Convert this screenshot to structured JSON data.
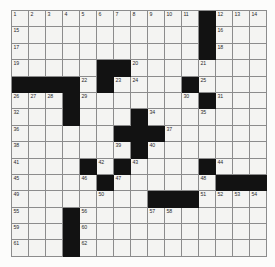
{
  "puzzle": {
    "type": "crossword-grid",
    "rows": 15,
    "columns": 15,
    "cell_size_px": 17,
    "colors": {
      "block": "#121212",
      "open": "#f4f4f2",
      "gridline": "#8c8c8c",
      "number_text": "#2a2a2a",
      "page_background": "#fcfcfb"
    },
    "blocks": [
      [
        0,
        11
      ],
      [
        1,
        11
      ],
      [
        2,
        11
      ],
      [
        3,
        5
      ],
      [
        3,
        6
      ],
      [
        4,
        0
      ],
      [
        4,
        1
      ],
      [
        4,
        2
      ],
      [
        4,
        3
      ],
      [
        4,
        5
      ],
      [
        4,
        10
      ],
      [
        5,
        3
      ],
      [
        5,
        11
      ],
      [
        6,
        3
      ],
      [
        6,
        7
      ],
      [
        7,
        6
      ],
      [
        7,
        7
      ],
      [
        7,
        8
      ],
      [
        8,
        7
      ],
      [
        9,
        4
      ],
      [
        9,
        6
      ],
      [
        9,
        11
      ],
      [
        10,
        5
      ],
      [
        10,
        12
      ],
      [
        10,
        13
      ],
      [
        10,
        14
      ],
      [
        11,
        8
      ],
      [
        11,
        9
      ],
      [
        11,
        10
      ],
      [
        12,
        3
      ],
      [
        13,
        3
      ],
      [
        14,
        3
      ]
    ],
    "numbers": [
      {
        "row": 0,
        "col": 0,
        "label": "1"
      },
      {
        "row": 0,
        "col": 1,
        "label": "2"
      },
      {
        "row": 0,
        "col": 2,
        "label": "3"
      },
      {
        "row": 0,
        "col": 3,
        "label": "4"
      },
      {
        "row": 0,
        "col": 4,
        "label": "5"
      },
      {
        "row": 0,
        "col": 5,
        "label": "6"
      },
      {
        "row": 0,
        "col": 6,
        "label": "7"
      },
      {
        "row": 0,
        "col": 7,
        "label": "8"
      },
      {
        "row": 0,
        "col": 8,
        "label": "9"
      },
      {
        "row": 0,
        "col": 9,
        "label": "10"
      },
      {
        "row": 0,
        "col": 10,
        "label": "11"
      },
      {
        "row": 0,
        "col": 12,
        "label": "12"
      },
      {
        "row": 0,
        "col": 13,
        "label": "13"
      },
      {
        "row": 0,
        "col": 14,
        "label": "14"
      },
      {
        "row": 1,
        "col": 0,
        "label": "15"
      },
      {
        "row": 1,
        "col": 12,
        "label": "16"
      },
      {
        "row": 2,
        "col": 0,
        "label": "17"
      },
      {
        "row": 2,
        "col": 12,
        "label": "18"
      },
      {
        "row": 3,
        "col": 0,
        "label": "19"
      },
      {
        "row": 3,
        "col": 7,
        "label": "20"
      },
      {
        "row": 3,
        "col": 11,
        "label": "21"
      },
      {
        "row": 4,
        "col": 4,
        "label": "22"
      },
      {
        "row": 4,
        "col": 6,
        "label": "23"
      },
      {
        "row": 4,
        "col": 7,
        "label": "24"
      },
      {
        "row": 4,
        "col": 11,
        "label": "25"
      },
      {
        "row": 5,
        "col": 0,
        "label": "26"
      },
      {
        "row": 5,
        "col": 1,
        "label": "27"
      },
      {
        "row": 5,
        "col": 2,
        "label": "28"
      },
      {
        "row": 5,
        "col": 4,
        "label": "29"
      },
      {
        "row": 5,
        "col": 10,
        "label": "30"
      },
      {
        "row": 5,
        "col": 12,
        "label": "31"
      },
      {
        "row": 6,
        "col": 0,
        "label": "32"
      },
      {
        "row": 6,
        "col": 3,
        "label": "33"
      },
      {
        "row": 6,
        "col": 8,
        "label": "34"
      },
      {
        "row": 6,
        "col": 11,
        "label": "35"
      },
      {
        "row": 7,
        "col": 0,
        "label": "36"
      },
      {
        "row": 7,
        "col": 9,
        "label": "37"
      },
      {
        "row": 8,
        "col": 0,
        "label": "38"
      },
      {
        "row": 8,
        "col": 6,
        "label": "39"
      },
      {
        "row": 8,
        "col": 8,
        "label": "40"
      },
      {
        "row": 9,
        "col": 0,
        "label": "41"
      },
      {
        "row": 9,
        "col": 5,
        "label": "42"
      },
      {
        "row": 9,
        "col": 7,
        "label": "43"
      },
      {
        "row": 9,
        "col": 12,
        "label": "44"
      },
      {
        "row": 10,
        "col": 0,
        "label": "45"
      },
      {
        "row": 10,
        "col": 4,
        "label": "46"
      },
      {
        "row": 10,
        "col": 6,
        "label": "47"
      },
      {
        "row": 10,
        "col": 11,
        "label": "48"
      },
      {
        "row": 11,
        "col": 0,
        "label": "49"
      },
      {
        "row": 11,
        "col": 5,
        "label": "50"
      },
      {
        "row": 11,
        "col": 11,
        "label": "51"
      },
      {
        "row": 11,
        "col": 12,
        "label": "52"
      },
      {
        "row": 11,
        "col": 13,
        "label": "53"
      },
      {
        "row": 11,
        "col": 14,
        "label": "54"
      },
      {
        "row": 12,
        "col": 0,
        "label": "55"
      },
      {
        "row": 12,
        "col": 4,
        "label": "56"
      },
      {
        "row": 12,
        "col": 8,
        "label": "57"
      },
      {
        "row": 12,
        "col": 9,
        "label": "58"
      },
      {
        "row": 13,
        "col": 0,
        "label": "59"
      },
      {
        "row": 13,
        "col": 4,
        "label": "60"
      },
      {
        "row": 14,
        "col": 0,
        "label": "61"
      },
      {
        "row": 14,
        "col": 4,
        "label": "62"
      }
    ]
  }
}
